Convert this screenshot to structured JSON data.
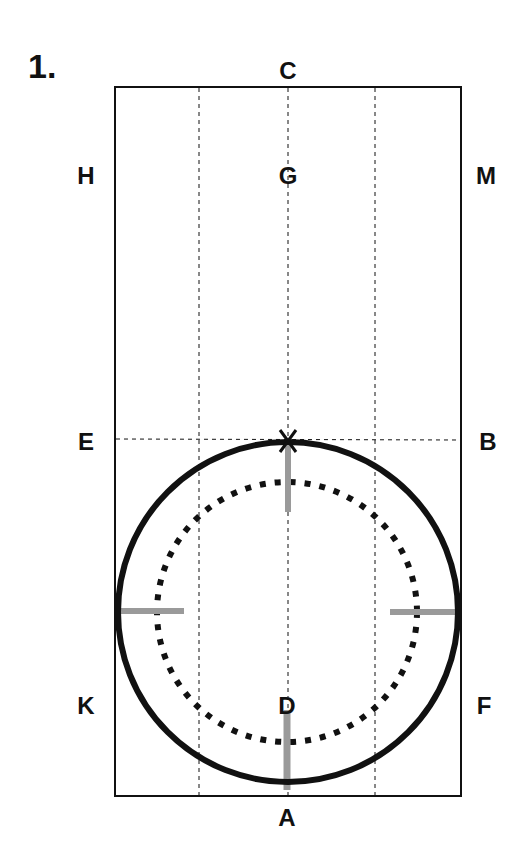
{
  "figure": {
    "number": "1.",
    "labels": {
      "C": "C",
      "H": "H",
      "G": "G",
      "M": "M",
      "E": "E",
      "B": "B",
      "K": "K",
      "D": "D",
      "F": "F",
      "A": "A"
    }
  },
  "colors": {
    "ink": "#111111",
    "marker_gray": "#9a9a9a",
    "background": "#ffffff"
  }
}
